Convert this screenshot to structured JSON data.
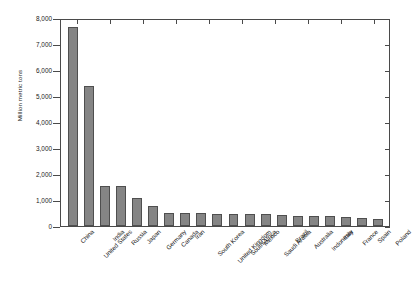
{
  "chart_data": {
    "type": "bar",
    "title": "",
    "subtitle": "",
    "xlabel": "",
    "ylabel": "Million metric tons",
    "ylim": [
      0,
      8000
    ],
    "yticks": [
      0,
      1000,
      2000,
      3000,
      4000,
      5000,
      6000,
      7000,
      8000
    ],
    "ytick_labels": [
      "0",
      "1,000",
      "2,000",
      "3,000",
      "4,000",
      "5,000",
      "6,000",
      "7,000",
      "8,000"
    ],
    "grid": false,
    "legend": null,
    "bar_color": "#858585",
    "bar_edge_color": "#4f4f4f",
    "axis_color": "#4a4a4a",
    "categories": [
      "China",
      "United States",
      "India",
      "Russia",
      "Japan",
      "Germany",
      "Canada",
      "Iran",
      "South Korea",
      "United Kingdom",
      "South Africa",
      "Mexico",
      "Saudi Arabia",
      "Brazil",
      "Australia",
      "Indonesia",
      "Italy",
      "France",
      "Spain",
      "Poland"
    ],
    "values": [
      7710,
      5420,
      1570,
      1540,
      1100,
      760,
      520,
      520,
      510,
      470,
      470,
      460,
      450,
      430,
      400,
      400,
      390,
      360,
      300,
      290
    ]
  }
}
